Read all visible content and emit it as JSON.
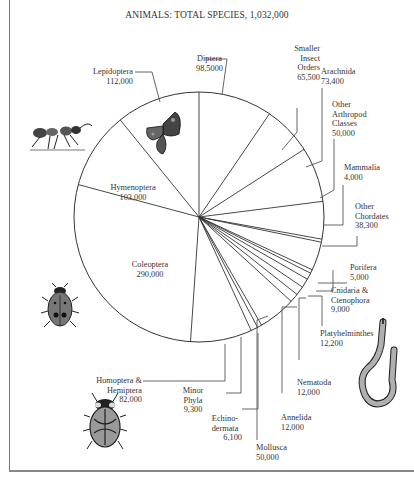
{
  "chart_data": {
    "type": "pie",
    "title": "ANIMALS: TOTAL SPECIES, 1,032,000",
    "total": 1032000,
    "start_angle_deg": -90,
    "direction": "clockwise",
    "slices": [
      {
        "name": "Diptera",
        "label_lines": [
          "Diptera"
        ],
        "value_text": "98,5000",
        "value": 98500
      },
      {
        "name": "Smaller Insect Orders",
        "label_lines": [
          "Smaller",
          "Insect",
          "Orders"
        ],
        "value_text": "65,500",
        "value": 65500
      },
      {
        "name": "Arachnida",
        "label_lines": [
          "Arachnida"
        ],
        "value_text": "73,400",
        "value": 73400
      },
      {
        "name": "Other Arthropod Classes",
        "label_lines": [
          "Other",
          "Arthropod",
          "Classes"
        ],
        "value_text": "50,000",
        "value": 50000
      },
      {
        "name": "Mammalia",
        "label_lines": [
          "Mammalia"
        ],
        "value_text": "4,000",
        "value": 4000
      },
      {
        "name": "Other Chordates",
        "label_lines": [
          "Other",
          "Chordates"
        ],
        "value_text": "38,300",
        "value": 38300
      },
      {
        "name": "Porifera",
        "label_lines": [
          "Porifera"
        ],
        "value_text": "5,000",
        "value": 5000
      },
      {
        "name": "Cnidaria & Ctenophora",
        "label_lines": [
          "Cnidaria &",
          "Ctenophora"
        ],
        "value_text": "9,000",
        "value": 9000
      },
      {
        "name": "Platyhelminthes",
        "label_lines": [
          "Platyhelminthes"
        ],
        "value_text": "12,200",
        "value": 12200
      },
      {
        "name": "Nematoda",
        "label_lines": [
          "Nematoda"
        ],
        "value_text": "12,000",
        "value": 12000
      },
      {
        "name": "Annelida",
        "label_lines": [
          "Annelida"
        ],
        "value_text": "12,000",
        "value": 12000
      },
      {
        "name": "Mollusca",
        "label_lines": [
          "Mollusca"
        ],
        "value_text": "50,000",
        "value": 50000
      },
      {
        "name": "Echinodermata",
        "label_lines": [
          "Echino-",
          "dermata"
        ],
        "value_text": "6,100",
        "value": 6100
      },
      {
        "name": "Minor Phyla",
        "label_lines": [
          "Minor",
          "Phyla"
        ],
        "value_text": "9,300",
        "value": 9300
      },
      {
        "name": "Homoptera & Hemiptera",
        "label_lines": [
          "Homoptera &",
          "Hemiptera"
        ],
        "value_text": "82,000",
        "value": 82000
      },
      {
        "name": "Coleoptera",
        "label_lines": [
          "Coleoptera"
        ],
        "value_text": "290,000",
        "value": 290000
      },
      {
        "name": "Hymenoptera",
        "label_lines": [
          "Hymenoptera"
        ],
        "value_text": "103,000",
        "value": 103000
      },
      {
        "name": "Lepidoptera",
        "label_lines": [
          "Lepidoptera"
        ],
        "value_text": "112,000",
        "value": 112000
      }
    ],
    "illustrations": [
      "ant",
      "butterfly",
      "ladybird-beetle",
      "shield-bug",
      "segmented-worm"
    ]
  },
  "labels": {
    "diptera": {
      "name": "Diptera",
      "value": "98,5000"
    },
    "smaller": {
      "l1": "Smaller",
      "l2": "Insect",
      "l3": "Orders",
      "value": "65,500"
    },
    "arachnida": {
      "name": "Arachnida",
      "value": "73,400"
    },
    "other_arthropod": {
      "l1": "Other",
      "l2": "Arthropod",
      "l3": "Classes",
      "value": "50,000"
    },
    "mammalia": {
      "name": "Mammalia",
      "value": "4,000"
    },
    "other_chordates": {
      "l1": "Other",
      "l2": "Chordates",
      "value": "38,300"
    },
    "porifera": {
      "name": "Porifera",
      "value": "5,000"
    },
    "cnidaria": {
      "l1": "Cnidaria &",
      "l2": "Ctenophora",
      "value": "9,000"
    },
    "platyhelminthes": {
      "name": "Platyhelminthes",
      "value": "12,200"
    },
    "nematoda": {
      "name": "Nematoda",
      "value": "12,000"
    },
    "annelida": {
      "name": "Annelida",
      "value": "12,000"
    },
    "mollusca": {
      "name": "Mollusca",
      "value": "50,000"
    },
    "echinodermata": {
      "l1": "Echino-",
      "l2": "dermata",
      "value": "6,100"
    },
    "minor_phyla": {
      "l1": "Minor",
      "l2": "Phyla",
      "value": "9,300"
    },
    "homoptera": {
      "l1": "Homoptera &",
      "l2": "Hemiptera",
      "value": "82,000"
    },
    "coleoptera": {
      "name": "Coleoptera",
      "value": "290,000"
    },
    "hymenoptera": {
      "name": "Hymenoptera",
      "value": "103,000"
    },
    "lepidoptera": {
      "name": "Lepidoptera",
      "value": "112,000"
    }
  },
  "colors": {
    "line": "#333333",
    "leader": "#555555",
    "frame": "#808080",
    "illustration_dark": "#2a2a2a",
    "illustration_mid": "#8a8a8a"
  }
}
